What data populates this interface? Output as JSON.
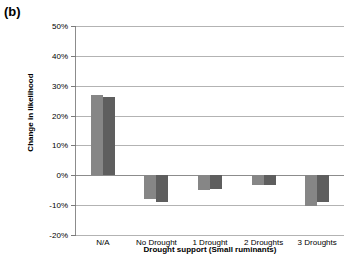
{
  "panel": {
    "label": "(b)"
  },
  "chart_data": {
    "type": "bar",
    "title": "",
    "xlabel": "Drought support (Small ruminants)",
    "ylabel": "Change in likelihood",
    "categories": [
      "N/A",
      "No Drought",
      "1 Drought",
      "2 Droughts",
      "3 Droughts"
    ],
    "series": [
      {
        "name": "series-1",
        "color": "#868686",
        "values": [
          26.8,
          -8.0,
          -5.0,
          -3.3,
          -10.2
        ]
      },
      {
        "name": "series-2",
        "color": "#5e5e5e",
        "values": [
          26.1,
          -9.0,
          -4.6,
          -3.3,
          -8.8
        ]
      }
    ],
    "ylim": [
      -20,
      50
    ],
    "ytick_values": [
      50,
      40,
      30,
      20,
      10,
      0,
      -10,
      -20
    ],
    "ytick_labels": [
      "50%",
      "40%",
      "30%",
      "20%",
      "10%",
      "0%",
      "-10%",
      "-20%"
    ],
    "grid": true,
    "legend": "none",
    "value_suffix": "%"
  }
}
